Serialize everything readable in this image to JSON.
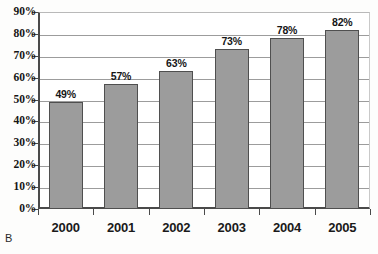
{
  "panel_label": "B",
  "chart_data": {
    "type": "bar",
    "title": "",
    "subtitle": "",
    "xlabel": "",
    "ylabel": "",
    "categories": [
      "2000",
      "2001",
      "2002",
      "2003",
      "2004",
      "2005"
    ],
    "values": [
      49,
      57,
      63,
      73,
      78,
      82
    ],
    "value_labels": [
      "49%",
      "57%",
      "63%",
      "73%",
      "78%",
      "82%"
    ],
    "ylim": [
      0,
      90
    ],
    "ytick_values": [
      0,
      10,
      20,
      30,
      40,
      50,
      60,
      70,
      80,
      90
    ],
    "ytick_labels": [
      "0%",
      "10%",
      "20%",
      "30%",
      "40%",
      "50%",
      "60%",
      "70%",
      "80%",
      "90%"
    ],
    "grid": true,
    "grid_axis": "y",
    "legend": false,
    "legend_position": "none",
    "bar_color": "#9c9c9c",
    "bar_edge_color": "#4f4f4f",
    "gridline_color": "#9c9c9c",
    "axis_color": "#4a4a4a",
    "background_color": "#ffffff"
  }
}
